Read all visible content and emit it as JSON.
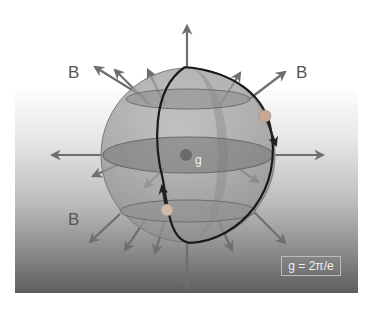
{
  "diagram": {
    "labels": {
      "b_top_left": "B",
      "b_top_right": "B",
      "b_bottom_left": "B",
      "center_charge": "g",
      "formula": "g = 2π/e"
    },
    "colors": {
      "arrow": "#6e6e6e",
      "sphere_fill": "#9e9e9e",
      "meridian": "#1a1a1a",
      "center_dot": "#6b6b6b",
      "charge_bead": "#c8c8c8"
    }
  }
}
